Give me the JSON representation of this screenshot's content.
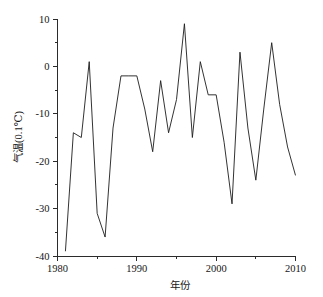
{
  "chart_data": {
    "type": "line",
    "title": "",
    "xlabel": "年份",
    "ylabel": "气温(0.1℃)",
    "xlim": [
      1980,
      2010
    ],
    "ylim": [
      -40,
      10
    ],
    "grid": false,
    "legend": null,
    "x_ticks": [
      1980,
      1990,
      2000,
      2010
    ],
    "x_tick_labels": [
      "1980",
      "1990",
      "2000",
      "2010"
    ],
    "x_minor_ticks": [
      1985,
      1995,
      2005
    ],
    "y_ticks": [
      10,
      0,
      -10,
      -20,
      -30,
      -40
    ],
    "y_tick_labels": [
      "10",
      "0",
      "-10",
      "-20",
      "-30",
      "-40"
    ],
    "y_minor_ticks": [
      5,
      -5,
      -15,
      -25,
      -35
    ],
    "series": [
      {
        "name": "气温距平",
        "color": "#1c1c1c",
        "x": [
          1981,
          1982,
          1983,
          1984,
          1985,
          1986,
          1987,
          1988,
          1989,
          1990,
          1991,
          1992,
          1993,
          1994,
          1995,
          1996,
          1997,
          1998,
          1999,
          2000,
          2001,
          2002,
          2003,
          2004,
          2005,
          2006,
          2007,
          2008,
          2009,
          2010
        ],
        "values": [
          -39,
          -14,
          -15,
          1,
          -31,
          -36,
          -13,
          -2,
          -2,
          -2,
          -9,
          -18,
          -3,
          -14,
          -7,
          9,
          -15,
          1,
          -6,
          -6,
          -16,
          -29,
          3,
          -13,
          -24,
          -9,
          5,
          -8,
          -17,
          -23
        ]
      }
    ]
  },
  "axis_labels": {
    "x_title": "年份",
    "y_title": "气温(0.1℃)"
  }
}
